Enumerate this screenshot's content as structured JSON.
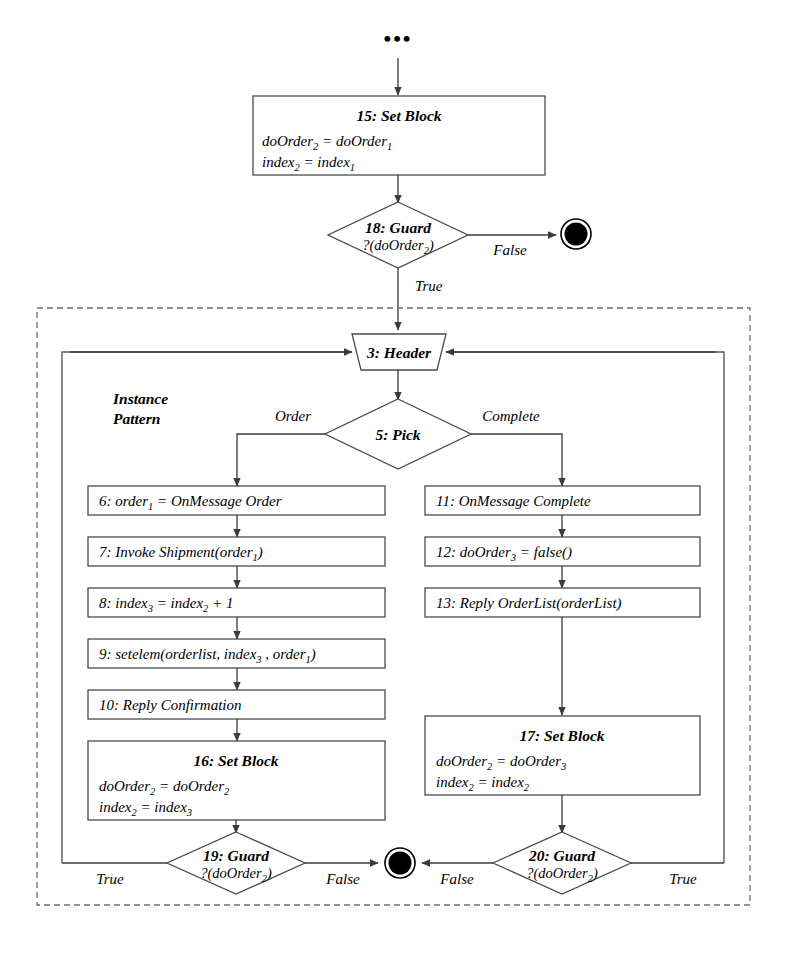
{
  "diagram": {
    "ellipsis": "•••",
    "group_label_line1": "Instance",
    "group_label_line2": "Pattern",
    "colors": {
      "stroke": "#4a4a4a",
      "connector": "#3c3c3c",
      "frame_inner": "#5a5a5a",
      "frame_outer": "#6e6e6e",
      "text": "#000000",
      "background": "#ffffff"
    }
  },
  "nodes": {
    "set_block_15": {
      "id": "15",
      "type": "set-block",
      "title": "15:  Set Block",
      "assignments": [
        {
          "lhs": "doOrder",
          "lhs_sub": "2",
          "rhs": "doOrder",
          "rhs_sub": "1"
        },
        {
          "lhs": "index",
          "lhs_sub": "2",
          "rhs": "index",
          "rhs_sub": "1"
        }
      ]
    },
    "guard_18": {
      "id": "18",
      "type": "guard",
      "title": "18: Guard",
      "condition_prefix": "?(doOrder",
      "condition_sub": "2",
      "condition_suffix": ")"
    },
    "header_3": {
      "id": "3",
      "type": "header",
      "title": "3:  Header"
    },
    "pick_5": {
      "id": "5",
      "type": "pick",
      "title": "5:  Pick"
    },
    "step_6": {
      "id": "6",
      "type": "action",
      "prefix": "6:  order",
      "prefix_sub": "1",
      "suffix": " = OnMessage Order"
    },
    "step_7": {
      "id": "7",
      "type": "action",
      "prefix": "7:  Invoke Shipment(order",
      "prefix_sub": "1",
      "suffix": ")"
    },
    "step_8": {
      "id": "8",
      "type": "action",
      "prefix": "8:  index",
      "prefix_sub": "3",
      "mid": " = index",
      "mid_sub": "2",
      "suffix": " + 1"
    },
    "step_9": {
      "id": "9",
      "type": "action",
      "prefix": "9:  setelem(orderlist, index",
      "prefix_sub": "3",
      "mid": " , order",
      "mid_sub": "1",
      "suffix": ")"
    },
    "step_10": {
      "id": "10",
      "type": "action",
      "label": "10:  Reply Confirmation"
    },
    "step_11": {
      "id": "11",
      "type": "action",
      "label": "11:  OnMessage Complete"
    },
    "step_12": {
      "id": "12",
      "type": "action",
      "prefix": "12:  doOrder",
      "prefix_sub": "3",
      "suffix": " = false()"
    },
    "step_13": {
      "id": "13",
      "type": "action",
      "label": "13:  Reply OrderList(orderList)"
    },
    "set_block_16": {
      "id": "16",
      "type": "set-block",
      "title": "16:  Set Block",
      "assignments": [
        {
          "lhs": "doOrder",
          "lhs_sub": "2",
          "rhs": "doOrder",
          "rhs_sub": "2"
        },
        {
          "lhs": "index",
          "lhs_sub": "2",
          "rhs": "index",
          "rhs_sub": "3"
        }
      ]
    },
    "set_block_17": {
      "id": "17",
      "type": "set-block",
      "title": "17:  Set Block",
      "assignments": [
        {
          "lhs": "doOrder",
          "lhs_sub": "2",
          "rhs": "doOrder",
          "rhs_sub": "3"
        },
        {
          "lhs": "index",
          "lhs_sub": "2",
          "rhs": "index",
          "rhs_sub": "2"
        }
      ]
    },
    "guard_19": {
      "id": "19",
      "type": "guard",
      "title": "19: Guard",
      "condition_prefix": "?(doOrder",
      "condition_sub": "2",
      "condition_suffix": ")"
    },
    "guard_20": {
      "id": "20",
      "type": "guard",
      "title": "20: Guard",
      "condition_prefix": "?(doOrder",
      "condition_sub": "2",
      "condition_suffix": ")"
    },
    "final_top": {
      "type": "final-node",
      "label": "final-node"
    },
    "final_bottom": {
      "type": "final-node",
      "label": "final-node"
    }
  },
  "edges": {
    "guard18_false": "False",
    "guard18_true": "True",
    "pick_order": "Order",
    "pick_complete": "Complete",
    "guard19_true": "True",
    "guard19_false": "False",
    "guard20_false": "False",
    "guard20_true": "True"
  }
}
